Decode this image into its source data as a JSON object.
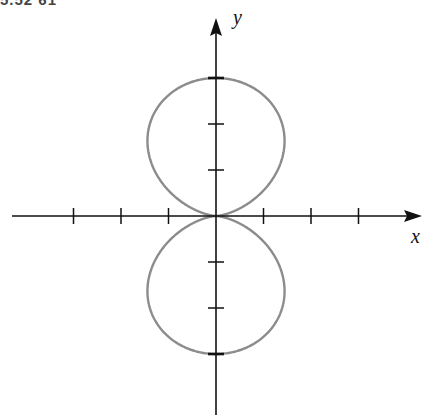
{
  "figure": {
    "cut_title": "5.52 61"
  },
  "chart_data": {
    "type": "line",
    "title": "",
    "xlabel": "x",
    "ylabel": "y",
    "grid": false,
    "legend": null,
    "curve": {
      "name": "polar curve",
      "color": "#8c8c8c",
      "parametric": "r = 3*sin(theta)^2 style figure-eight; lobes above and below the x-axis",
      "points": [
        [
          0,
          0
        ],
        [
          0.6,
          0.6
        ],
        [
          1.2,
          1.2
        ],
        [
          1.8,
          1.9
        ],
        [
          2.0,
          2.4
        ],
        [
          1.8,
          2.8
        ],
        [
          1.0,
          3.0
        ],
        [
          0,
          3.0
        ],
        [
          -1.0,
          3.0
        ],
        [
          -1.8,
          2.8
        ],
        [
          -2.0,
          2.4
        ],
        [
          -1.8,
          1.9
        ],
        [
          -1.2,
          1.2
        ],
        [
          -0.6,
          0.6
        ],
        [
          0,
          0
        ],
        [
          0.6,
          -0.6
        ],
        [
          1.2,
          -1.2
        ],
        [
          1.8,
          -1.9
        ],
        [
          2.0,
          -2.4
        ],
        [
          1.8,
          -2.8
        ],
        [
          1.0,
          -3.0
        ],
        [
          0,
          -3.0
        ],
        [
          -1.0,
          -3.0
        ],
        [
          -1.8,
          -2.8
        ],
        [
          -2.0,
          -2.4
        ],
        [
          -1.8,
          -1.9
        ],
        [
          -1.2,
          -1.2
        ],
        [
          -0.6,
          -0.6
        ],
        [
          0,
          0
        ]
      ]
    },
    "x_ticks": [
      -3,
      -2,
      -1,
      1,
      2,
      3
    ],
    "y_ticks": [
      -3,
      -2,
      -1,
      1,
      2,
      3
    ],
    "xlim": [
      -4.3,
      4.2
    ],
    "ylim": [
      -4.3,
      4.6
    ],
    "x_tick_labels": [],
    "y_tick_labels": []
  },
  "colors": {
    "axis": "#111111",
    "curve": "#8c8c8c",
    "background": "#ffffff"
  }
}
